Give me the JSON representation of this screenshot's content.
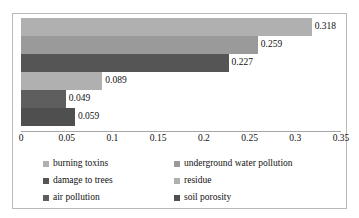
{
  "chart_data": {
    "type": "bar",
    "orientation": "horizontal",
    "title": "",
    "xlabel": "",
    "ylabel": "",
    "xlim": [
      0,
      0.35
    ],
    "grid": false,
    "legend_position": "bottom",
    "tick_labels": [
      "0",
      "0.05",
      "0.1",
      "0.15",
      "0.2",
      "0.25",
      "0.3",
      "0.35"
    ],
    "ticks": [
      0,
      0.05,
      0.1,
      0.15,
      0.2,
      0.25,
      0.3,
      0.35
    ],
    "categories": [
      "burning toxins",
      "underground water pollution",
      "damage to trees",
      "residue",
      "air pollution",
      "soil porosity"
    ],
    "values": [
      0.318,
      0.259,
      0.227,
      0.089,
      0.049,
      0.059
    ],
    "value_labels": [
      "0.318",
      "0.259",
      "0.227",
      "0.089",
      "0.049",
      "0.059"
    ],
    "colors": [
      "#b0b0b0",
      "#9a9a9a",
      "#555555",
      "#b0b0b0",
      "#5e5e5e",
      "#4f4f4f"
    ],
    "bars": [
      {
        "category": "burning toxins",
        "value": 0.318,
        "label": "0.318",
        "color": "#b0b0b0"
      },
      {
        "category": "underground water pollution",
        "value": 0.259,
        "label": "0.259",
        "color": "#9a9a9a"
      },
      {
        "category": "damage to trees",
        "value": 0.227,
        "label": "0.227",
        "color": "#555555"
      },
      {
        "category": "residue",
        "value": 0.089,
        "label": "0.089",
        "color": "#b0b0b0"
      },
      {
        "category": "air pollution",
        "value": 0.049,
        "label": "0.049",
        "color": "#5e5e5e"
      },
      {
        "category": "soil porosity",
        "value": 0.059,
        "label": "0.059",
        "color": "#4f4f4f"
      }
    ],
    "legend": [
      {
        "label": "burning toxins",
        "color": "#b0b0b0"
      },
      {
        "label": "underground water pollution",
        "color": "#9a9a9a"
      },
      {
        "label": "damage to trees",
        "color": "#555555"
      },
      {
        "label": "residue",
        "color": "#b0b0b0"
      },
      {
        "label": "air pollution",
        "color": "#5e5e5e"
      },
      {
        "label": "soil porosity",
        "color": "#4f4f4f"
      }
    ]
  }
}
